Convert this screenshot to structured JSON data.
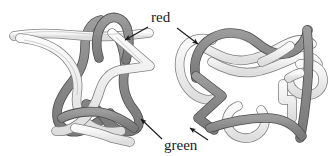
{
  "figure": {
    "kind": "knot-diagram-pair",
    "background_color": "#ffffff"
  },
  "labels": {
    "red": {
      "text": "red",
      "band": "dark",
      "color_name": "red",
      "swatch": "#8c8c8c"
    },
    "green": {
      "text": "green",
      "band": "light",
      "color_name": "green",
      "swatch": "#e6e6e6"
    }
  },
  "bands": {
    "dark": {
      "name": "red-band",
      "fill": "#8c8c8c",
      "stroke": "#4d4d4d",
      "highlight": "#a6a6a6"
    },
    "light": {
      "name": "green-band",
      "fill": "#ececec",
      "stroke": "#808080",
      "highlight": "#fafafa"
    }
  },
  "diagrams": [
    {
      "id": "left-diagram",
      "name": "left-knot-diagram",
      "position": "left"
    },
    {
      "id": "right-diagram",
      "name": "right-knot-diagram",
      "position": "right"
    }
  ],
  "annotations": [
    {
      "name": "red-arrow-left",
      "label": "red",
      "points_to": "left-diagram",
      "direction": "down-left"
    },
    {
      "name": "red-arrow-right",
      "label": "red",
      "points_to": "right-diagram",
      "direction": "down-left"
    },
    {
      "name": "green-arrow-left",
      "label": "green",
      "points_to": "left-diagram",
      "direction": "up-left"
    },
    {
      "name": "green-arrow-right",
      "label": "green",
      "points_to": "right-diagram",
      "direction": "up-right"
    }
  ]
}
